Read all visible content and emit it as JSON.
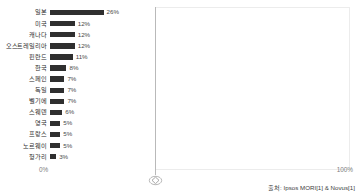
{
  "chart_data": {
    "type": "bar",
    "orientation": "horizontal",
    "title": "",
    "xlabel": "",
    "ylabel": "",
    "xlim": [
      0,
      100
    ],
    "grid": false,
    "legend": null,
    "axis_ticks": [
      "0%",
      "100%"
    ],
    "bar_color": "#2f2f2f",
    "categories": [
      "일본",
      "미국",
      "캐나다",
      "오스트레일리아",
      "핀란드",
      "한국",
      "스페인",
      "독일",
      "벨기에",
      "스웨덴",
      "영국",
      "프랑스",
      "노르웨이",
      "헝가리"
    ],
    "values": [
      26,
      12,
      12,
      12,
      11,
      8,
      7,
      7,
      7,
      6,
      5,
      5,
      5,
      3
    ],
    "value_labels": [
      "26%",
      "12%",
      "12%",
      "12%",
      "11%",
      "8%",
      "7%",
      "7%",
      "7%",
      "6%",
      "5%",
      "5%",
      "5%",
      "3%"
    ]
  },
  "axis": {
    "min_label": "0%",
    "max_label": "100%"
  },
  "footer": {
    "source": "출처: Ipsos MORI[1] & Novus[1]"
  },
  "marker": {
    "name": "diamond-marker"
  }
}
